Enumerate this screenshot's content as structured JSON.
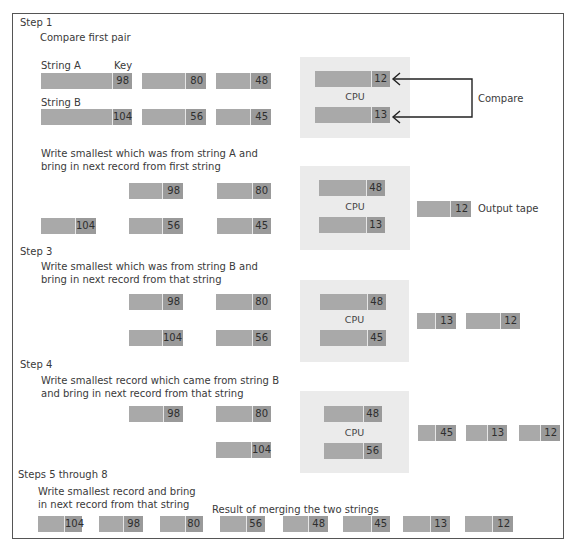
{
  "steps": {
    "step1": {
      "title": "Step 1",
      "desc": "Compare first pair",
      "string_a_label": "String A",
      "key_label": "Key",
      "string_b_label": "String B",
      "string_a": [
        "98",
        "80",
        "48"
      ],
      "string_b": [
        "104",
        "56",
        "45"
      ],
      "cpu_label": "CPU",
      "cpu": [
        "12",
        "13"
      ],
      "compare_label": "Compare"
    },
    "step2": {
      "desc_line1": "Write smallest which was from  string A and",
      "desc_line2": "bring in next  record from first string",
      "string_a": [
        "98",
        "80"
      ],
      "string_b": [
        "104",
        "56",
        "45"
      ],
      "cpu_label": "CPU",
      "cpu": [
        "48",
        "13"
      ],
      "output": [
        "12"
      ],
      "output_label": "Output tape"
    },
    "step3": {
      "title": "Step 3",
      "desc_line1": "Write smallest which was from  string B and",
      "desc_line2": "bring in next   record from that string",
      "string_a": [
        "98",
        "80"
      ],
      "string_b": [
        "104",
        "56"
      ],
      "cpu_label": "CPU",
      "cpu": [
        "48",
        "45"
      ],
      "output": [
        "13",
        "12"
      ]
    },
    "step4": {
      "title": "Step 4",
      "desc_line1": "Write smallest record which came from string B",
      "desc_line2": "and  bring   in next record from that string",
      "string_a": [
        "98",
        "80"
      ],
      "string_b": [
        "104"
      ],
      "cpu_label": "CPU",
      "cpu": [
        "48",
        "56"
      ],
      "output": [
        "45",
        "13",
        "12"
      ]
    },
    "step5": {
      "title": "Steps 5 through 8",
      "desc_line1": "Write smallest  record and bring",
      "desc_line2": "in next record from that string",
      "result_label": "Result of merging the two strings",
      "result": [
        "104",
        "98",
        "80",
        "56",
        "48",
        "45",
        "13",
        "12"
      ]
    }
  }
}
